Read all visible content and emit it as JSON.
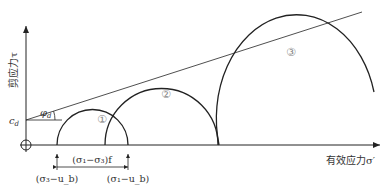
{
  "diagram": {
    "y_axis_label": "剪应力τ",
    "x_axis_label": "有效应力σ′",
    "cohesion_label": "c",
    "cohesion_sub": "d",
    "friction_label": "φ",
    "friction_sub": "d",
    "circles": [
      {
        "id": "1",
        "label": "①"
      },
      {
        "id": "2",
        "label": "②"
      },
      {
        "id": "3",
        "label": "③"
      }
    ],
    "dimension_label": "(σ₁−σ₃)f",
    "left_marker_label": "(σ₃−u_b)",
    "right_marker_label": "(σ₁−u_b)",
    "colors": {
      "stroke": "#222222",
      "text": "#333333",
      "circle_label": "#888888"
    }
  }
}
